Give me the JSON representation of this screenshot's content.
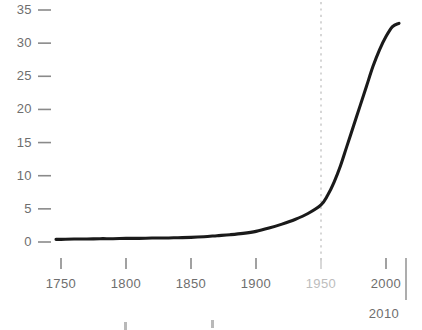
{
  "chart_data": {
    "type": "line",
    "title": "",
    "subtitle": "",
    "xlabel": "",
    "ylabel": "",
    "xlim": [
      1740,
      2010
    ],
    "ylim": [
      0,
      36
    ],
    "grid": false,
    "legend": null,
    "x_ticks": [
      {
        "value": 1750,
        "label": "1750",
        "style": "normal"
      },
      {
        "value": 1800,
        "label": "1800",
        "style": "normal"
      },
      {
        "value": 1850,
        "label": "1850",
        "style": "normal"
      },
      {
        "value": 1900,
        "label": "1900",
        "style": "normal"
      },
      {
        "value": 1950,
        "label": "1950",
        "style": "muted"
      },
      {
        "value": 2000,
        "label": "2000",
        "style": "normal"
      }
    ],
    "axis_end": {
      "value": 2010,
      "label": "2010"
    },
    "y_ticks": [
      {
        "value": 0,
        "label": "0"
      },
      {
        "value": 5,
        "label": "5"
      },
      {
        "value": 10,
        "label": "10"
      },
      {
        "value": 15,
        "label": "15"
      },
      {
        "value": 20,
        "label": "20"
      },
      {
        "value": 25,
        "label": "25"
      },
      {
        "value": 30,
        "label": "30"
      },
      {
        "value": 35,
        "label": "35"
      }
    ],
    "annotations": [
      {
        "type": "vertical-dashed-line",
        "x": 1950,
        "color": "#cccccc",
        "label": ""
      }
    ],
    "series": [
      {
        "name": "",
        "color": "#1a1a1a",
        "x": [
          1740,
          1750,
          1760,
          1770,
          1780,
          1790,
          1800,
          1810,
          1820,
          1830,
          1840,
          1850,
          1860,
          1870,
          1880,
          1890,
          1900,
          1910,
          1920,
          1930,
          1940,
          1950,
          1955,
          1960,
          1965,
          1970,
          1975,
          1980,
          1985,
          1990,
          1995,
          2000,
          2005,
          2010
        ],
        "y": [
          0.4,
          0.4,
          0.45,
          0.45,
          0.5,
          0.5,
          0.55,
          0.55,
          0.6,
          0.6,
          0.65,
          0.7,
          0.8,
          0.95,
          1.1,
          1.3,
          1.6,
          2.1,
          2.7,
          3.4,
          4.3,
          5.6,
          7.0,
          9.0,
          11.5,
          14.5,
          17.5,
          20.5,
          23.5,
          26.5,
          29.0,
          31.0,
          32.5,
          33.0
        ]
      }
    ]
  },
  "colors": {
    "curve": "#1a1a1a",
    "tick": "#8a8a8a",
    "tick_label": "#6e6e6e",
    "muted_label": "#bdbdbd",
    "dashed_marker": "#cccccc",
    "background": "#ffffff"
  }
}
